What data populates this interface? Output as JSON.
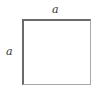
{
  "diagram": {
    "shape": "square",
    "labels": {
      "top": "a",
      "left": "a"
    },
    "colors": {
      "highlighted_edges": "#6a6a6a",
      "other_edges": "#a8a8a8"
    }
  }
}
